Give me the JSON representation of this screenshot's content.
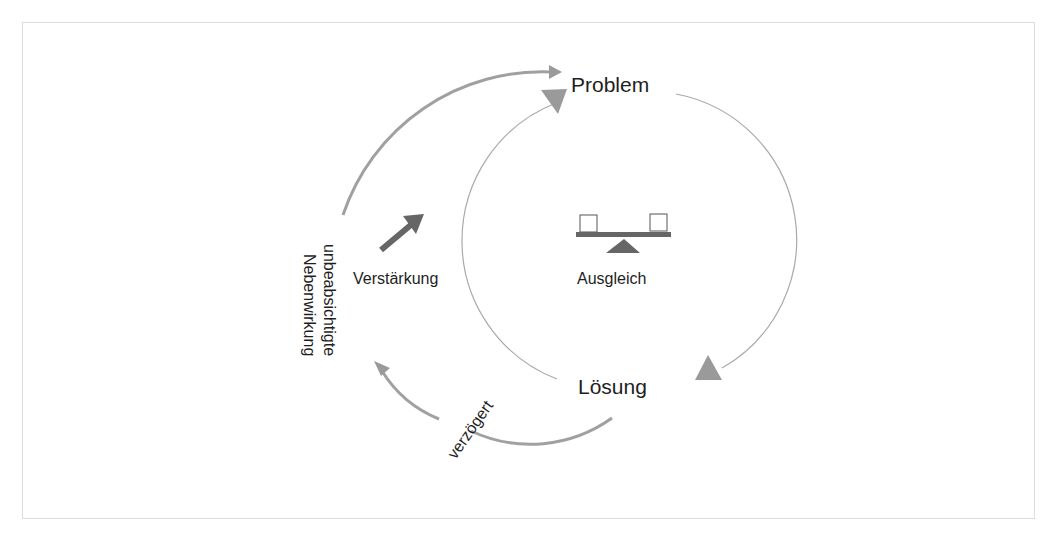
{
  "diagram": {
    "type": "causal-loop",
    "nodes": {
      "problem": "Problem",
      "solution": "Lösung"
    },
    "labels": {
      "balancing": "Ausgleich",
      "reinforcing": "Verstärkung",
      "side_effect_line1": "unbeabsichtigte",
      "side_effect_line2": "Nebenwirkung",
      "delayed": "verzögert"
    },
    "icons": {
      "balancing": "seesaw-icon",
      "reinforcing": "arrow-up-right-icon"
    },
    "colors": {
      "thin_line": "#aaaaaa",
      "thick_line": "#a0a0a0",
      "arrowhead": "#999999",
      "icon_dark": "#666666",
      "text": "#1e1e1e",
      "frame": "#dcdcdc"
    }
  }
}
